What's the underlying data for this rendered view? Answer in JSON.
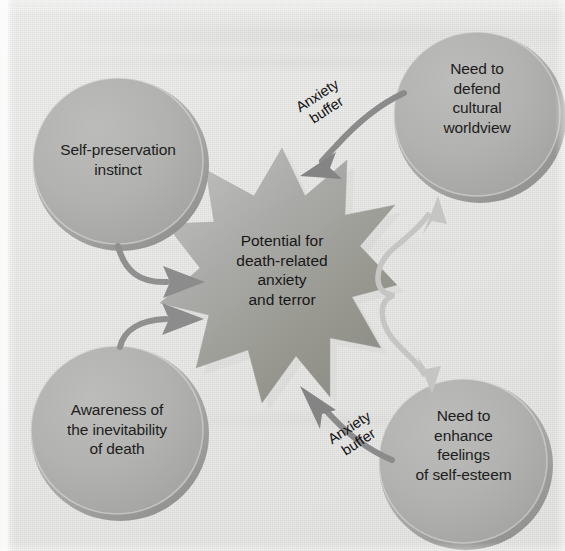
{
  "diagram": {
    "background_color": "#e9e9e7",
    "node_fill_color": "#b2b2b0",
    "star_fill_color": "#9e9e9c",
    "text_color": "#1d1d1d"
  },
  "nodes": [
    {
      "id": "self-preservation",
      "label": "Self-preservation\ninstinct",
      "position": "top-left"
    },
    {
      "id": "defend-worldview",
      "label": "Need to\ndefend\ncultural\nworldview",
      "position": "top-right"
    },
    {
      "id": "awareness-of-death",
      "label": "Awareness of\nthe inevitability\nof death",
      "position": "bottom-left"
    },
    {
      "id": "enhance-self-esteem",
      "label": "Need to\nenhance\nfeelings\nof self-esteem",
      "position": "bottom-right"
    }
  ],
  "center": {
    "id": "death-anxiety",
    "label": "Potential for\ndeath-related\nanxiety\nand terror",
    "shape": "starburst"
  },
  "edge_labels": {
    "top": "Anxiety\nbuffer",
    "bottom": "Anxiety\nbuffer"
  },
  "arrows": [
    {
      "from": "self-preservation",
      "to": "death-anxiety",
      "style": "dark",
      "label": ""
    },
    {
      "from": "awareness-of-death",
      "to": "death-anxiety",
      "style": "dark",
      "label": ""
    },
    {
      "from": "death-anxiety",
      "to": "defend-worldview",
      "style": "light",
      "label": ""
    },
    {
      "from": "death-anxiety",
      "to": "enhance-self-esteem",
      "style": "light",
      "label": ""
    },
    {
      "from": "defend-worldview",
      "to": "death-anxiety",
      "style": "dark",
      "label": "Anxiety\nbuffer"
    },
    {
      "from": "enhance-self-esteem",
      "to": "death-anxiety",
      "style": "dark",
      "label": "Anxiety\nbuffer"
    }
  ]
}
